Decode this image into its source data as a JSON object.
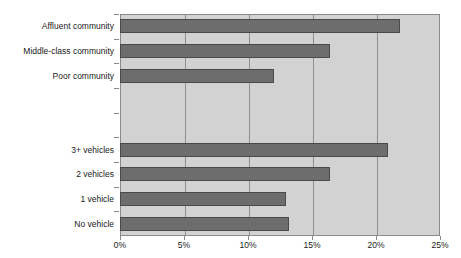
{
  "chart_data": {
    "type": "bar",
    "orientation": "horizontal",
    "title": "",
    "xlabel": "",
    "ylabel": "",
    "xlim": [
      0,
      25
    ],
    "xtick_labels": [
      "0%",
      "5%",
      "10%",
      "15%",
      "20%",
      "25%"
    ],
    "xtick_values": [
      0,
      5,
      10,
      15,
      20,
      25
    ],
    "grid": true,
    "legend": "none",
    "units": "percent",
    "categories": [
      "Affluent community",
      "Middle-class community",
      "Poor community",
      "",
      "",
      "3+ vehicles",
      "2 vehicles",
      "1 vehicle",
      "No vehicle"
    ],
    "values": [
      21.9,
      16.4,
      12.0,
      null,
      null,
      20.9,
      16.4,
      13.0,
      13.2
    ],
    "series": [
      {
        "name": "Share",
        "points": [
          {
            "category": "Affluent community",
            "value": 21.9,
            "label": "21.9%"
          },
          {
            "category": "Middle-class community",
            "value": 16.4,
            "label": "16.4%"
          },
          {
            "category": "Poor community",
            "value": 12.0,
            "label": "12.0%"
          },
          {
            "category": "3+ vehicles",
            "value": 20.9,
            "label": "20.9%"
          },
          {
            "category": "2 vehicles",
            "value": 16.4,
            "label": "16.4%"
          },
          {
            "category": "1 vehicle",
            "value": 13.0,
            "label": "13.0%"
          },
          {
            "category": "No vehicle",
            "value": 13.2,
            "label": "13.2%"
          }
        ]
      }
    ],
    "groups": [
      {
        "name": "Community type",
        "categories": [
          "Affluent community",
          "Middle-class community",
          "Poor community"
        ]
      },
      {
        "name": "Vehicle ownership",
        "categories": [
          "3+ vehicles",
          "2 vehicles",
          "1 vehicle",
          "No vehicle"
        ]
      }
    ],
    "colors": {
      "bar_fill": "#6d6d6d",
      "bar_edge": "#4a4a4a",
      "plot_background": "#d2d2d2",
      "gridline": "#8f8f8f",
      "axis": "#8a8a8a",
      "text": "#1a1a1a",
      "figure_background": "#ffffff"
    }
  }
}
